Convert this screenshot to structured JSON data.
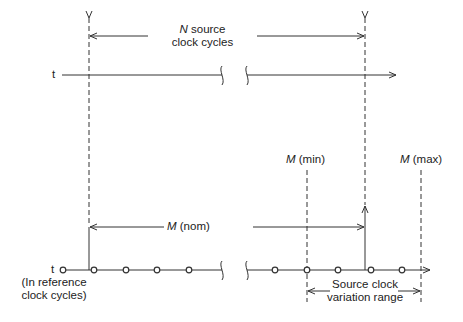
{
  "diagram": {
    "top_line": {
      "label": "t"
    },
    "bottom_line": {
      "label": "t",
      "sublabel_1": "(In reference",
      "sublabel_2": "clock cycles)"
    },
    "n_arrow": {
      "var": "N",
      "text_1": " source",
      "text_2": "clock cycles"
    },
    "m_nom": {
      "var": "M",
      "text": " (nom)"
    },
    "m_min": {
      "var": "M",
      "text": " (min)"
    },
    "m_max": {
      "var": "M",
      "text": " (max)"
    },
    "variation": {
      "line_1": "Source clock",
      "line_2": "variation range"
    }
  }
}
